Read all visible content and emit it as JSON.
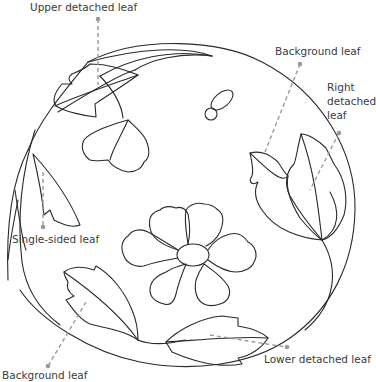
{
  "diagram": {
    "colors": {
      "outline": "#2a2a2a",
      "callout": "#9a9a9a",
      "label_text": "#3b3b3b",
      "background": "#ffffff"
    },
    "labels": {
      "upper_detached_leaf": "Upper detached leaf",
      "background_leaf_top": "Background leaf",
      "right_detached_leaf": "Right\ndetached\nleaf",
      "single_sided_leaf": "Single-sided leaf",
      "lower_detached_leaf": "Lower detached leaf",
      "background_leaf_bottom": "Background leaf"
    },
    "elements": [
      "outer-circle-frame",
      "central-flower",
      "upper-detached-leaf",
      "upper-bud",
      "seed-pod",
      "background-leaf-top-right",
      "right-detached-leaf",
      "single-sided-leaf",
      "background-leaf-bottom-left",
      "lower-detached-leaf"
    ]
  }
}
